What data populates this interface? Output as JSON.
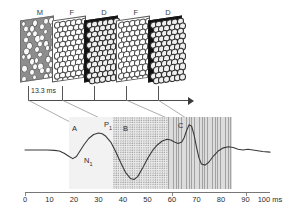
{
  "figure": {
    "title": "",
    "stimulus_sequence": {
      "frames": [
        {
          "label": "M",
          "kind": "mask",
          "x": 20
        },
        {
          "label": "F",
          "kind": "figure",
          "x": 52
        },
        {
          "label": "D",
          "kind": "dark",
          "x": 84
        },
        {
          "label": "F",
          "kind": "figure",
          "x": 116
        },
        {
          "label": "D",
          "kind": "dark",
          "x": 148
        }
      ],
      "frame_labels": [
        "M",
        "F",
        "D",
        "F",
        "D"
      ],
      "frame_duration_label": "13.3 ms",
      "timeline_arrow": true
    },
    "waveform": {
      "peak_labels": [
        {
          "text": "A",
          "x": 72,
          "y": 8
        },
        {
          "text": "P",
          "sub": "1",
          "x": 105,
          "y": 4
        },
        {
          "text": "B",
          "x": 124,
          "y": 8
        },
        {
          "text": "N",
          "sub": "1",
          "x": 86,
          "y": 40
        },
        {
          "text": "C",
          "x": 180,
          "y": 6
        }
      ],
      "bands": [
        {
          "name": "A",
          "start_ms": 15,
          "end_ms": 35
        },
        {
          "name": "B",
          "start_ms": 35,
          "end_ms": 60
        },
        {
          "name": "C",
          "start_ms": 60,
          "end_ms": 89
        }
      ]
    }
  },
  "chart_data": {
    "type": "line",
    "title": "",
    "xlabel": "100 ms",
    "ylabel": "",
    "xlim": [
      -4,
      104
    ],
    "ylim": [
      -1.05,
      1.05
    ],
    "grid": false,
    "legend": "none",
    "x_tick_labels": [
      "0",
      "10",
      "20",
      "30",
      "40",
      "50",
      "60",
      "70",
      "80",
      "90",
      "100 ms"
    ],
    "x_ticks": [
      0,
      10,
      20,
      30,
      40,
      50,
      60,
      70,
      80,
      90,
      100
    ],
    "annotations": [
      "A",
      "P1",
      "N1",
      "B",
      "C"
    ],
    "shaded_bands": [
      {
        "label": "A",
        "from": 15,
        "to": 35,
        "pattern": "fine-dots"
      },
      {
        "label": "B",
        "from": 35,
        "to": 60,
        "pattern": "dense-dots"
      },
      {
        "label": "C",
        "from": 60,
        "to": 89,
        "pattern": "vertical-lines"
      }
    ],
    "series": [
      {
        "name": "evoked potential",
        "x": [
          0,
          3,
          6,
          9,
          12,
          14,
          16,
          18,
          19.5,
          21,
          22.5,
          24,
          26,
          28,
          30,
          31.5,
          33,
          35,
          37,
          39,
          41,
          43,
          44.5,
          46,
          48,
          50,
          52,
          54,
          56,
          58,
          59.5,
          61,
          62.5,
          64,
          65,
          66,
          67,
          68,
          69,
          70,
          71,
          72,
          73.5,
          75,
          77,
          79,
          81,
          83,
          85,
          87,
          89,
          91,
          93,
          95,
          97,
          100
        ],
        "y": [
          0.0,
          0.0,
          0.0,
          0.0,
          -0.01,
          -0.03,
          -0.09,
          -0.18,
          -0.24,
          -0.18,
          -0.02,
          0.14,
          0.32,
          0.43,
          0.47,
          0.45,
          0.38,
          0.22,
          -0.04,
          -0.34,
          -0.62,
          -0.79,
          -0.82,
          -0.74,
          -0.5,
          -0.24,
          -0.02,
          0.14,
          0.25,
          0.3,
          0.28,
          0.22,
          0.18,
          0.22,
          0.35,
          0.55,
          0.7,
          0.66,
          0.42,
          0.08,
          -0.22,
          -0.39,
          -0.42,
          -0.34,
          -0.16,
          -0.02,
          0.06,
          0.09,
          0.07,
          0.02,
          0.0,
          0.02,
          0.0,
          -0.02,
          -0.04,
          -0.06
        ]
      }
    ]
  }
}
